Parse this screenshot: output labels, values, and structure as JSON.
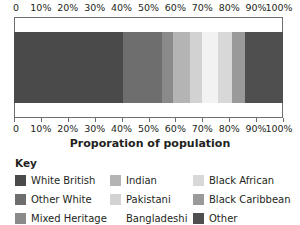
{
  "chart_data": {
    "type": "bar",
    "orientation": "horizontal-stacked",
    "title": "",
    "xlabel": "Proporation of population",
    "ylabel": "",
    "xlim": [
      0,
      100
    ],
    "grid": false,
    "legend_position": "bottom",
    "legend_title": "Key",
    "categories": [
      "Proporation of population"
    ],
    "tick_labels": [
      "0",
      "10%",
      "20%",
      "30%",
      "40%",
      "50%",
      "60%",
      "70%",
      "80%",
      "90%",
      "100%"
    ],
    "tick_values": [
      0,
      10,
      20,
      30,
      40,
      50,
      60,
      70,
      80,
      90,
      100
    ],
    "series": [
      {
        "name": "White British",
        "values": [
          40.5
        ],
        "color": "#4a4a4a"
      },
      {
        "name": "Other White",
        "values": [
          14.5
        ],
        "color": "#6e6e6e"
      },
      {
        "name": "Mixed Heritage",
        "values": [
          4.0
        ],
        "color": "#8a8a8a"
      },
      {
        "name": "Indian",
        "values": [
          6.5
        ],
        "color": "#b4b4b4"
      },
      {
        "name": "Pakistani",
        "values": [
          4.5
        ],
        "color": "#d2d2d2"
      },
      {
        "name": "Bangladeshi",
        "values": [
          6.0
        ],
        "color": "#f2f2f2"
      },
      {
        "name": "Black African",
        "values": [
          5.0
        ],
        "color": "#d8d8d8"
      },
      {
        "name": "Black Caribbean",
        "values": [
          5.0
        ],
        "color": "#9a9a9a"
      },
      {
        "name": "Other",
        "values": [
          14.0
        ],
        "color": "#4f4f4f"
      }
    ]
  },
  "axis": {
    "title": "Proporation of population"
  },
  "key": {
    "title": "Key",
    "rows": [
      [
        {
          "label": "White British",
          "color": "#4a4a4a"
        },
        {
          "label": "Indian",
          "color": "#b4b4b4"
        },
        {
          "label": "Black African",
          "color": "#d8d8d8"
        }
      ],
      [
        {
          "label": "Other White",
          "color": "#6e6e6e"
        },
        {
          "label": "Pakistani",
          "color": "#d2d2d2"
        },
        {
          "label": "Black Caribbean",
          "color": "#9a9a9a"
        }
      ],
      [
        {
          "label": "Mixed Heritage",
          "color": "#8a8a8a"
        },
        {
          "label": "Bangladeshi",
          "color": "#ffffff"
        },
        {
          "label": "Other",
          "color": "#4f4f4f"
        }
      ]
    ]
  }
}
